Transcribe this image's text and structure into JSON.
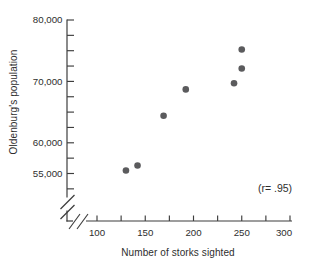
{
  "figure": {
    "background_color": "#ffffff",
    "axis_color": "#3d3d3d",
    "text_color": "#2e2e2e",
    "point_color": "#5b5b5d"
  },
  "chart_data": {
    "type": "scatter",
    "title": "",
    "xlabel": "Number of storks sighted",
    "ylabel": "Oldenburg's population",
    "annotation": "(r= .95)",
    "correlation_r": 0.95,
    "xlim": [
      100,
      300
    ],
    "ylim": [
      55000,
      80000
    ],
    "axis_breaks": {
      "x_axis": true,
      "y_axis": true
    },
    "grid": false,
    "legend": false,
    "x_major_ticks": [
      {
        "value": 100,
        "label": "100"
      },
      {
        "value": 150,
        "label": "150"
      },
      {
        "value": 200,
        "label": "200"
      },
      {
        "value": 250,
        "label": "250"
      },
      {
        "value": 300,
        "label": "300"
      }
    ],
    "x_minor_ticks": [
      125,
      175,
      225,
      275
    ],
    "y_major_ticks": [
      {
        "value": 80000,
        "label": "80,000"
      },
      {
        "value": 70000,
        "label": "70,000"
      },
      {
        "value": 60000,
        "label": "60,000"
      },
      {
        "value": 55000,
        "label": "55,000"
      }
    ],
    "y_minor_ticks": [
      77500,
      75000,
      72500,
      67500,
      65000,
      62500,
      57500,
      52500
    ],
    "points": [
      {
        "x": 130,
        "y": 55500
      },
      {
        "x": 142,
        "y": 56300
      },
      {
        "x": 169,
        "y": 64400
      },
      {
        "x": 192,
        "y": 68700
      },
      {
        "x": 242,
        "y": 69700
      },
      {
        "x": 250,
        "y": 72100
      },
      {
        "x": 250,
        "y": 75200
      }
    ]
  }
}
